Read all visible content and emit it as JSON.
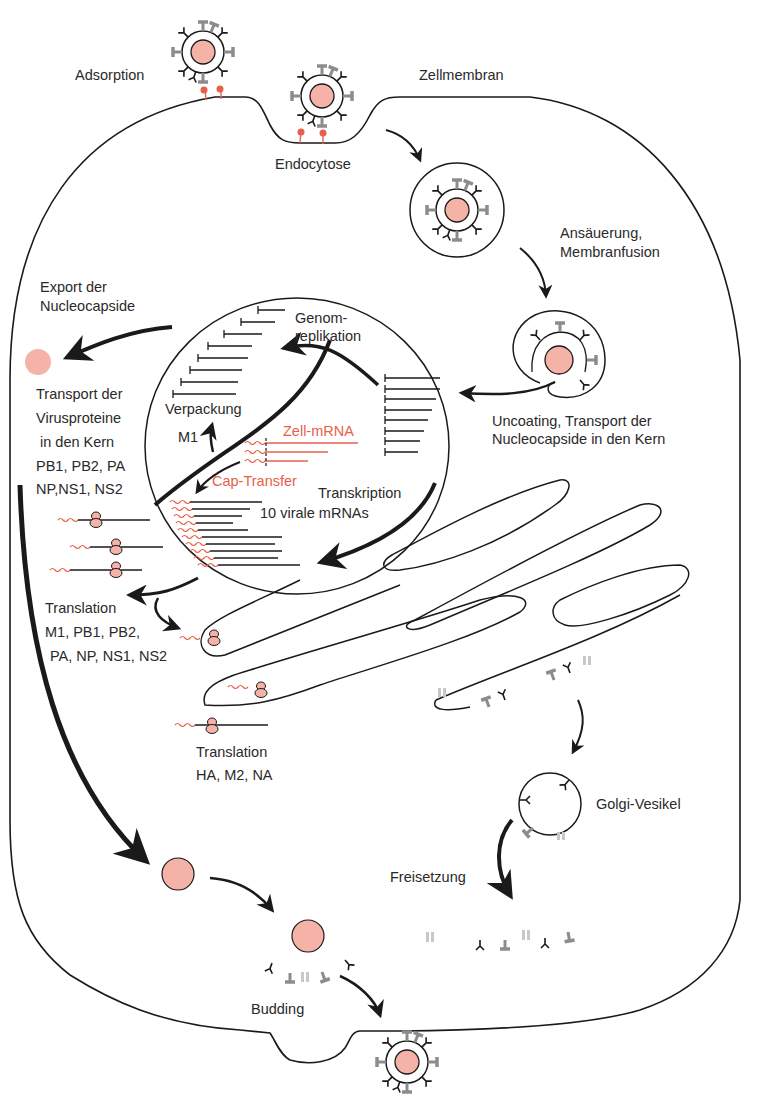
{
  "diagram": {
    "colors": {
      "line": "#1a1a1a",
      "capsid_fill": "#f5b3a8",
      "accent_red": "#e8604a",
      "gray_spike": "#8c8c8c",
      "light_spike": "#c8c8c8"
    },
    "labels": {
      "adsorption": "Adsorption",
      "zellmembran": "Zellmembran",
      "endocytose": "Endocytose",
      "ansaeuerung_1": "Ansäuerung,",
      "ansaeuerung_2": "Membranfusion",
      "export_1": "Export der",
      "export_2": "Nucleocapside",
      "genom_1": "Genom-",
      "genom_2": "replikation",
      "verpackung": "Verpackung",
      "m1": "M1",
      "zell_mrna": "Zell-mRNA",
      "cap_transfer": "Cap-Transfer",
      "transkription": "Transkription",
      "virale_mrnas": "10 virale mRNAs",
      "uncoating_1": "Uncoating, Transport der",
      "uncoating_2": "Nucleocapside in den Kern",
      "transport_1": "Transport der",
      "transport_2": "Virusproteine",
      "transport_3": "in den Kern",
      "transport_4": "PB1, PB2, PA",
      "transport_5": "NP,NS1, NS2",
      "translation1_1": "Translation",
      "translation1_2": "M1, PB1, PB2,",
      "translation1_3": "PA, NP, NS1, NS2",
      "translation2_1": "Translation",
      "translation2_2": "HA, M2, NA",
      "golgi": "Golgi-Vesikel",
      "freisetzung": "Freisetzung",
      "budding": "Budding"
    }
  }
}
